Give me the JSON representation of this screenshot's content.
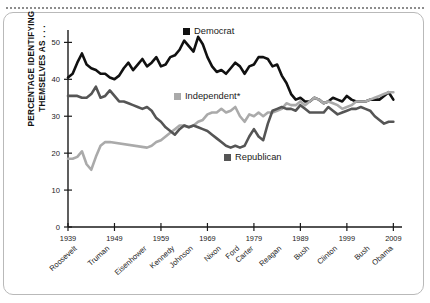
{
  "chart_data": {
    "type": "line",
    "title": "",
    "xlabel": "",
    "ylabel": "PERCENTAGE IDENTIFYING THEMSELVES AS . . .",
    "xlim": [
      1939,
      2010
    ],
    "ylim": [
      0,
      52
    ],
    "yticks": [
      0,
      10,
      20,
      30,
      40,
      50
    ],
    "xticks": [
      1939,
      1949,
      1959,
      1969,
      1979,
      1989,
      1999,
      2009
    ],
    "grid": false,
    "legend_position": "inside",
    "presidents": [
      {
        "name": "Roosevelt",
        "x": 1941
      },
      {
        "name": "Truman",
        "x": 1948
      },
      {
        "name": "Eisenhower",
        "x": 1956
      },
      {
        "name": "Kennedy",
        "x": 1962
      },
      {
        "name": "Johnson",
        "x": 1966
      },
      {
        "name": "Nixon",
        "x": 1972
      },
      {
        "name": "Ford",
        "x": 1976
      },
      {
        "name": "Carter",
        "x": 1979
      },
      {
        "name": "Reagan",
        "x": 1985
      },
      {
        "name": "Bush",
        "x": 1991
      },
      {
        "name": "Clinton",
        "x": 1997
      },
      {
        "name": "Bush",
        "x": 2004
      },
      {
        "name": "Obama",
        "x": 2009
      }
    ],
    "series": [
      {
        "name": "Democrat",
        "color": "#111111",
        "x": [
          1939,
          1940,
          1941,
          1942,
          1943,
          1944,
          1945,
          1946,
          1947,
          1948,
          1949,
          1950,
          1951,
          1952,
          1953,
          1954,
          1955,
          1956,
          1957,
          1958,
          1959,
          1960,
          1961,
          1962,
          1963,
          1964,
          1965,
          1966,
          1967,
          1968,
          1969,
          1970,
          1971,
          1972,
          1973,
          1974,
          1975,
          1976,
          1977,
          1978,
          1979,
          1980,
          1981,
          1982,
          1983,
          1984,
          1985,
          1986,
          1987,
          1988,
          1989,
          1990,
          1991,
          1992,
          1993,
          1994,
          1995,
          1996,
          1997,
          1998,
          1999,
          2000,
          2001,
          2002,
          2003,
          2004,
          2005,
          2006,
          2007,
          2008,
          2009
        ],
        "values": [
          40.5,
          41.5,
          44.5,
          47,
          44,
          43,
          42.5,
          41.5,
          41.5,
          40.5,
          40,
          41,
          43,
          44.5,
          42.5,
          44,
          45.5,
          43.5,
          44.5,
          46,
          43.5,
          44,
          46,
          46.5,
          48,
          50.5,
          49,
          47.5,
          51.5,
          49.5,
          46,
          43.5,
          42,
          42.5,
          41.5,
          43,
          44.5,
          43.5,
          41.5,
          43.5,
          44,
          46,
          46,
          45.5,
          43.5,
          44,
          41,
          39,
          36,
          34.5,
          35,
          34,
          34,
          35,
          34.5,
          33.5,
          34,
          35,
          34.5,
          34,
          35.5,
          34.5,
          34,
          34,
          34,
          34.5,
          34.5,
          34.5,
          35.5,
          36.5,
          34.5
        ]
      },
      {
        "name": "Independent*",
        "color": "#aaaaaa",
        "x": [
          1939,
          1940,
          1941,
          1942,
          1943,
          1944,
          1945,
          1946,
          1947,
          1948,
          1956,
          1957,
          1958,
          1959,
          1960,
          1961,
          1962,
          1963,
          1964,
          1965,
          1966,
          1967,
          1968,
          1969,
          1970,
          1971,
          1972,
          1973,
          1974,
          1975,
          1976,
          1977,
          1978,
          1979,
          1980,
          1981,
          1982,
          1983,
          1984,
          1985,
          1986,
          1987,
          1988,
          1989,
          1990,
          1991,
          1992,
          1993,
          1994,
          1995,
          1996,
          1997,
          1998,
          1999,
          2000,
          2001,
          2002,
          2003,
          2004,
          2005,
          2006,
          2007,
          2008,
          2009
        ],
        "values": [
          18.5,
          18.5,
          19,
          20.5,
          17,
          15.5,
          19,
          22,
          23,
          23,
          21.5,
          22,
          23,
          23.5,
          24.5,
          25.5,
          26.5,
          27.5,
          27.5,
          27,
          27.5,
          28.5,
          29,
          30.5,
          31,
          31,
          32,
          31,
          31.5,
          32.5,
          30,
          28.5,
          30.5,
          30,
          31,
          30,
          31,
          31,
          31.5,
          32,
          33.5,
          33,
          33,
          34,
          33,
          34,
          35,
          34.5,
          33.5,
          34,
          33.5,
          33,
          32,
          32.5,
          33,
          34,
          34,
          34,
          34.5,
          35,
          35.5,
          36,
          36.5,
          36.5
        ]
      },
      {
        "name": "Republican",
        "color": "#555555",
        "x": [
          1939,
          1940,
          1941,
          1942,
          1943,
          1944,
          1945,
          1946,
          1947,
          1948,
          1949,
          1950,
          1951,
          1952,
          1953,
          1954,
          1955,
          1956,
          1957,
          1958,
          1959,
          1960,
          1961,
          1962,
          1963,
          1964,
          1965,
          1966,
          1967,
          1968,
          1969,
          1970,
          1971,
          1972,
          1973,
          1974,
          1975,
          1976,
          1977,
          1978,
          1979,
          1980,
          1981,
          1982,
          1983,
          1984,
          1985,
          1986,
          1987,
          1988,
          1989,
          1990,
          1991,
          1992,
          1993,
          1994,
          1995,
          1996,
          1997,
          1998,
          1999,
          2000,
          2001,
          2002,
          2003,
          2004,
          2005,
          2006,
          2007,
          2008,
          2009
        ],
        "values": [
          35.5,
          35.5,
          35.5,
          35,
          35,
          36,
          38,
          35,
          35.5,
          37,
          35.5,
          34,
          34,
          33.5,
          33,
          32.5,
          32,
          32.5,
          31.5,
          29.5,
          28.5,
          27,
          26,
          25,
          26.5,
          27.5,
          27,
          27.5,
          27,
          26.5,
          26,
          25,
          24,
          23,
          22,
          21.5,
          22,
          21.5,
          22,
          24.5,
          26.5,
          24.5,
          23.5,
          28,
          31.5,
          32,
          32.5,
          32,
          32,
          31.5,
          33,
          32,
          31,
          31,
          31,
          31,
          32.5,
          31.5,
          30.5,
          31,
          31.5,
          32,
          32,
          32.5,
          32,
          31.5,
          30,
          29,
          28,
          28.5,
          28.5
        ]
      }
    ]
  },
  "legend": {
    "democrat": "Democrat",
    "independent": "Independent*",
    "republican": "Republican"
  },
  "axis": {
    "ylabel": "PERCENTAGE IDENTIFYING THEMSELVES AS . . ."
  }
}
